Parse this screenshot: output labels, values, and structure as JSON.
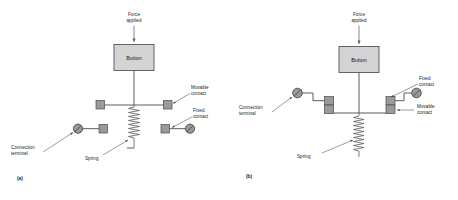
{
  "figure": {
    "background_color": "#ffffff",
    "panels": [
      {
        "tag": "(a)",
        "state": "normally-open / released",
        "labels": {
          "force": "Force\napplied",
          "force_line1": "Force",
          "force_line2": "applied",
          "button": "Button",
          "movable_contact_line1": "Movable",
          "movable_contact_line2": "contact",
          "fixed_contact_line1": "Fixed",
          "fixed_contact_line2": "contact",
          "connection_terminal_line1": "Connection",
          "connection_terminal_line2": "terminal",
          "spring": "Spring"
        }
      },
      {
        "tag": "(b)",
        "state": "normally-closed / pressed",
        "labels": {
          "force_line1": "Force",
          "force_line2": "applied",
          "button": "Button",
          "fixed_contact_line1": "Fixed",
          "fixed_contact_line2": "contact",
          "movable_contact_line1": "Movable",
          "movable_contact_line2": "contact",
          "connection_terminal_line1": "Connection",
          "connection_terminal_line2": "terminal",
          "spring": "Spring"
        }
      }
    ],
    "colors": {
      "wire": "#4a4a4a",
      "button_fill": "#d4d4d4",
      "button_border": "#555555",
      "contact_fill": "#9a9a9a",
      "terminal_fill": "#9a9a9a",
      "force_line": "#6b6b8a",
      "text": "#1a1a1a"
    }
  }
}
